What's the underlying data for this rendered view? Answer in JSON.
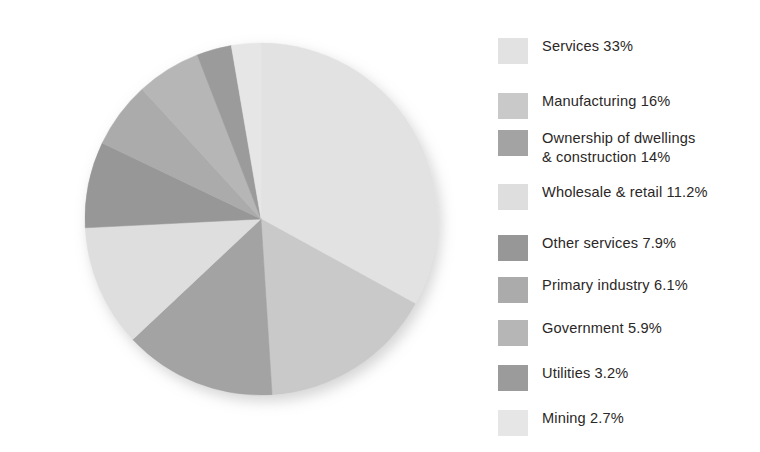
{
  "chart_data": {
    "type": "pie",
    "title": "",
    "subtitle": "",
    "xlabel": "",
    "ylabel": "",
    "legend_position": "right",
    "grid": false,
    "start_angle_deg": 0,
    "direction": "clockwise",
    "unit": "%",
    "categories": [
      "Services",
      "Manufacturing",
      "Ownership of dwellings & construction",
      "Wholesale & retail",
      "Other services",
      "Primary industry",
      "Government",
      "Utilities",
      "Mining"
    ],
    "values": [
      33,
      16,
      14,
      11.2,
      7.9,
      6.1,
      5.9,
      3.2,
      2.7
    ],
    "total": 100,
    "colors": [
      "#e2e2e2",
      "#c9c9c9",
      "#a3a3a3",
      "#dedede",
      "#979797",
      "#ababab",
      "#b6b6b6",
      "#9b9b9b",
      "#e6e6e6"
    ],
    "slices": [
      {
        "label": "Services",
        "value": 33,
        "value_text": "33%",
        "color": "#e2e2e2"
      },
      {
        "label": "Manufacturing",
        "value": 16,
        "value_text": "16%",
        "color": "#c9c9c9"
      },
      {
        "label": "Ownership of dwellings & construction",
        "value": 14,
        "value_text": "14%",
        "color": "#a3a3a3"
      },
      {
        "label": "Wholesale & retail",
        "value": 11.2,
        "value_text": "11.2%",
        "color": "#dedede"
      },
      {
        "label": "Other services",
        "value": 7.9,
        "value_text": "7.9%",
        "color": "#979797"
      },
      {
        "label": "Primary industry",
        "value": 6.1,
        "value_text": "6.1%",
        "color": "#ababab"
      },
      {
        "label": "Government",
        "value": 5.9,
        "value_text": "5.9%",
        "color": "#b6b6b6"
      },
      {
        "label": "Utilities",
        "value": 3.2,
        "value_text": "3.2%",
        "color": "#9b9b9b"
      },
      {
        "label": "Mining",
        "value": 2.7,
        "value_text": "2.7%",
        "color": "#e6e6e6"
      }
    ]
  },
  "legend": {
    "items": [
      {
        "text": "Services 33%",
        "color": "#e2e2e2",
        "y": 18,
        "lines": 1
      },
      {
        "text": "Manufacturing 16%",
        "color": "#c9c9c9",
        "y": 73,
        "lines": 1
      },
      {
        "text": "Ownership of dwellings\n& construction 14%",
        "color": "#a3a3a3",
        "y": 110,
        "lines": 2
      },
      {
        "text": "Wholesale & retail 11.2%",
        "color": "#dedede",
        "y": 164,
        "lines": 1
      },
      {
        "text": "Other services 7.9%",
        "color": "#979797",
        "y": 215,
        "lines": 1
      },
      {
        "text": "Primary industry 6.1%",
        "color": "#ababab",
        "y": 257,
        "lines": 1
      },
      {
        "text": "Government 5.9%",
        "color": "#b6b6b6",
        "y": 300,
        "lines": 1
      },
      {
        "text": "Utilities 3.2%",
        "color": "#9b9b9b",
        "y": 345,
        "lines": 1
      },
      {
        "text": "Mining 2.7%",
        "color": "#e6e6e6",
        "y": 390,
        "lines": 1
      }
    ]
  },
  "pie_geometry": {
    "cx": 261,
    "cy": 219,
    "r": 176
  },
  "background_color": "#ffffff"
}
